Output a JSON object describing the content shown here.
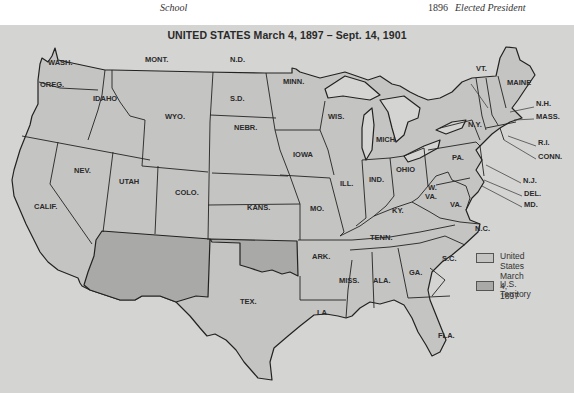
{
  "page_header": {
    "left_text": "School",
    "year": "1896",
    "right_text": "Elected President"
  },
  "map": {
    "title": "UNITED STATES March 4, 1897 – Sept. 14, 1901",
    "colors": {
      "background": "#d4d4d2",
      "state_fill": "#c4c4c2",
      "territory_fill": "#a9a9a7",
      "lake_fill": "#d4d4d2",
      "border": "#222222"
    },
    "states": [
      {
        "label": "WASH.",
        "x": 48,
        "y": 63
      },
      {
        "label": "OREG.",
        "x": 40,
        "y": 85
      },
      {
        "label": "IDAHO",
        "x": 93,
        "y": 99
      },
      {
        "label": "MONT.",
        "x": 145,
        "y": 60
      },
      {
        "label": "WYO.",
        "x": 165,
        "y": 117
      },
      {
        "label": "N.D.",
        "x": 230,
        "y": 60
      },
      {
        "label": "S.D.",
        "x": 230,
        "y": 99
      },
      {
        "label": "NEBR.",
        "x": 234,
        "y": 128
      },
      {
        "label": "MINN.",
        "x": 283,
        "y": 82
      },
      {
        "label": "IOWA",
        "x": 293,
        "y": 155
      },
      {
        "label": "WIS.",
        "x": 328,
        "y": 117
      },
      {
        "label": "MICH.",
        "x": 376,
        "y": 140
      },
      {
        "label": "NEV.",
        "x": 74,
        "y": 171
      },
      {
        "label": "UTAH",
        "x": 119,
        "y": 182
      },
      {
        "label": "COLO.",
        "x": 175,
        "y": 193
      },
      {
        "label": "KANS.",
        "x": 247,
        "y": 208
      },
      {
        "label": "CALIF.",
        "x": 34,
        "y": 207
      },
      {
        "label": "MO.",
        "x": 310,
        "y": 209
      },
      {
        "label": "ILL.",
        "x": 340,
        "y": 184
      },
      {
        "label": "IND.",
        "x": 369,
        "y": 180
      },
      {
        "label": "OHIO",
        "x": 396,
        "y": 170
      },
      {
        "label": "KY.",
        "x": 392,
        "y": 211
      },
      {
        "label": "W.",
        "x": 428,
        "y": 188
      },
      {
        "label": "VA.",
        "x": 425,
        "y": 197
      },
      {
        "label": "VA.",
        "x": 450,
        "y": 205
      },
      {
        "label": "PA.",
        "x": 452,
        "y": 158
      },
      {
        "label": "N.Y.",
        "x": 468,
        "y": 125
      },
      {
        "label": "VT.",
        "x": 476,
        "y": 69
      },
      {
        "label": "MAINE",
        "x": 507,
        "y": 83
      },
      {
        "label": "TENN.",
        "x": 370,
        "y": 238
      },
      {
        "label": "N.C.",
        "x": 475,
        "y": 229
      },
      {
        "label": "S.C.",
        "x": 442,
        "y": 259
      },
      {
        "label": "ARK.",
        "x": 312,
        "y": 257
      },
      {
        "label": "MISS.",
        "x": 339,
        "y": 281
      },
      {
        "label": "ALA.",
        "x": 373,
        "y": 281
      },
      {
        "label": "GA.",
        "x": 409,
        "y": 273
      },
      {
        "label": "TEX.",
        "x": 240,
        "y": 302
      },
      {
        "label": "LA.",
        "x": 317,
        "y": 313
      },
      {
        "label": "FLA.",
        "x": 438,
        "y": 336
      }
    ],
    "callouts": [
      {
        "label": "N.H.",
        "x": 536,
        "y": 104
      },
      {
        "label": "MASS.",
        "x": 536,
        "y": 117
      },
      {
        "label": "R.I.",
        "x": 538,
        "y": 143
      },
      {
        "label": "CONN.",
        "x": 538,
        "y": 157
      },
      {
        "label": "N.J.",
        "x": 523,
        "y": 181
      },
      {
        "label": "DEL.",
        "x": 524,
        "y": 194
      },
      {
        "label": "MD.",
        "x": 524,
        "y": 205
      }
    ],
    "legend": [
      {
        "label_line1": "United States",
        "label_line2": "March 4, 1897",
        "swatch": "#c4c4c2"
      },
      {
        "label_line1": "U.S. Territory",
        "label_line2": "",
        "swatch": "#a9a9a7"
      }
    ]
  }
}
